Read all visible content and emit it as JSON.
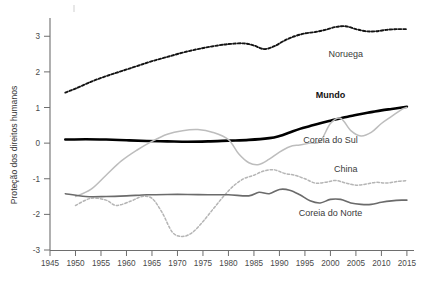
{
  "chart_data": {
    "type": "line",
    "title": "",
    "subtitle": "",
    "xlabel": "",
    "ylabel": "Proteção dos direitos humanos",
    "xlim": [
      1945,
      2016
    ],
    "ylim": [
      -3,
      3.4
    ],
    "grid": false,
    "legend_position": "inline-right",
    "x_ticks": [
      1945,
      1950,
      1955,
      1960,
      1965,
      1970,
      1975,
      1980,
      1985,
      1990,
      1995,
      2000,
      2005,
      2010,
      2015
    ],
    "x_tick_labels": [
      "1945",
      "1950",
      "1955",
      "1960",
      "1965",
      "1970",
      "1975",
      "1980",
      "1985",
      "1990",
      "1995",
      "2000",
      "2005",
      "2010",
      "2015"
    ],
    "y_ticks": [
      3,
      2,
      1,
      0,
      -1,
      -2,
      -3
    ],
    "y_tick_labels": [
      "3",
      "2",
      "1",
      "0",
      "-1",
      "-2",
      "-3"
    ],
    "series": [
      {
        "name": "Noruega",
        "label": "Noruega",
        "color": "#141414",
        "style": "dashed",
        "width": 1.9,
        "bold_label": false,
        "label_x": 2003,
        "label_y": 2.42,
        "x": [
          1948,
          1950,
          1953,
          1956,
          1959,
          1962,
          1965,
          1968,
          1971,
          1974,
          1977,
          1980,
          1983,
          1985,
          1987,
          1989,
          1991,
          1993,
          1995,
          1997,
          1999,
          2001,
          2003,
          2005,
          2007,
          2009,
          2011,
          2013,
          2015
        ],
        "values": [
          1.42,
          1.53,
          1.72,
          1.88,
          2.02,
          2.16,
          2.3,
          2.42,
          2.54,
          2.64,
          2.72,
          2.78,
          2.8,
          2.74,
          2.64,
          2.72,
          2.88,
          3.0,
          3.08,
          3.12,
          3.18,
          3.26,
          3.28,
          3.2,
          3.14,
          3.14,
          3.18,
          3.2,
          3.2
        ]
      },
      {
        "name": "Mundo",
        "label": "Mundo",
        "color": "#000000",
        "style": "solid",
        "width": 2.6,
        "bold_label": true,
        "label_x": 2000,
        "label_y": 1.28,
        "x": [
          1948,
          1952,
          1956,
          1960,
          1964,
          1968,
          1972,
          1976,
          1980,
          1984,
          1988,
          1990,
          1992,
          1994,
          1996,
          1998,
          2000,
          2002,
          2004,
          2006,
          2008,
          2010,
          2012,
          2014,
          2015
        ],
        "values": [
          0.1,
          0.11,
          0.1,
          0.08,
          0.06,
          0.05,
          0.04,
          0.05,
          0.07,
          0.09,
          0.14,
          0.2,
          0.3,
          0.4,
          0.48,
          0.56,
          0.63,
          0.7,
          0.76,
          0.82,
          0.87,
          0.92,
          0.96,
          1.0,
          1.02
        ]
      },
      {
        "name": "Coreia do Sul",
        "label": "Coreia do Sul",
        "color": "#bdbdbd",
        "style": "solid",
        "width": 1.5,
        "bold_label": false,
        "label_x": 2000,
        "label_y": 0.0,
        "x": [
          1950,
          1953,
          1956,
          1959,
          1962,
          1965,
          1968,
          1971,
          1974,
          1977,
          1980,
          1982,
          1984,
          1986,
          1988,
          1990,
          1992,
          1994,
          1996,
          1998,
          2000,
          2002,
          2004,
          2006,
          2008,
          2010,
          2012,
          2014,
          2015
        ],
        "values": [
          -1.5,
          -1.3,
          -0.9,
          -0.5,
          -0.2,
          0.05,
          0.25,
          0.35,
          0.38,
          0.3,
          0.1,
          -0.3,
          -0.55,
          -0.6,
          -0.45,
          -0.25,
          -0.1,
          -0.05,
          0.0,
          0.05,
          0.55,
          0.7,
          0.35,
          0.2,
          0.3,
          0.55,
          0.75,
          0.95,
          1.0
        ]
      },
      {
        "name": "China",
        "label": "China",
        "color": "#b5b5b5",
        "style": "dashed",
        "width": 1.5,
        "bold_label": false,
        "label_x": 2003,
        "label_y": -0.82,
        "x": [
          1950,
          1953,
          1956,
          1958,
          1961,
          1963,
          1965,
          1967,
          1969,
          1971,
          1973,
          1975,
          1977,
          1979,
          1981,
          1983,
          1985,
          1987,
          1989,
          1991,
          1993,
          1995,
          1997,
          1999,
          2001,
          2003,
          2005,
          2007,
          2009,
          2011,
          2013,
          2015
        ],
        "values": [
          -1.75,
          -1.55,
          -1.6,
          -1.75,
          -1.62,
          -1.5,
          -1.55,
          -1.95,
          -2.5,
          -2.62,
          -2.5,
          -2.2,
          -1.85,
          -1.5,
          -1.2,
          -1.0,
          -0.9,
          -0.78,
          -0.75,
          -0.85,
          -0.9,
          -1.0,
          -1.12,
          -1.1,
          -1.05,
          -1.12,
          -1.18,
          -1.15,
          -1.1,
          -1.12,
          -1.08,
          -1.05
        ]
      },
      {
        "name": "Coreia do Norte",
        "label": "Coreia do Norte",
        "color": "#6b6b6b",
        "style": "solid",
        "width": 1.6,
        "bold_label": false,
        "label_x": 2000,
        "label_y": -2.04,
        "x": [
          1948,
          1952,
          1956,
          1960,
          1964,
          1968,
          1972,
          1976,
          1980,
          1984,
          1986,
          1988,
          1990,
          1992,
          1994,
          1996,
          1998,
          2000,
          2002,
          2004,
          2006,
          2008,
          2010,
          2012,
          2014,
          2015
        ],
        "values": [
          -1.42,
          -1.5,
          -1.5,
          -1.48,
          -1.45,
          -1.44,
          -1.44,
          -1.45,
          -1.45,
          -1.48,
          -1.38,
          -1.42,
          -1.3,
          -1.32,
          -1.45,
          -1.62,
          -1.68,
          -1.58,
          -1.58,
          -1.68,
          -1.72,
          -1.72,
          -1.66,
          -1.62,
          -1.6,
          -1.6
        ]
      }
    ]
  }
}
